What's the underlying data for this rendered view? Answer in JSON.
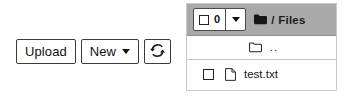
{
  "toolbar": {
    "upload_label": "Upload",
    "new_label": "New",
    "new_caret_icon": "caret-down-icon",
    "refresh_icon": "refresh-icon"
  },
  "file_panel": {
    "header": {
      "select_all_checkbox_icon": "checkbox-unchecked-icon",
      "selected_count": "0",
      "select_menu_caret_icon": "caret-down-icon",
      "breadcrumb": {
        "root_icon": "folder-filled-icon",
        "separator": "/",
        "label": "Files"
      }
    },
    "columns": [
      "select",
      "icon",
      "name"
    ],
    "rows": [
      {
        "type": "parent-directory",
        "checkbox": false,
        "icon": "folder-outline-icon",
        "name": ".."
      },
      {
        "type": "file",
        "checkbox": true,
        "icon": "file-outline-icon",
        "name": "test.txt"
      }
    ]
  },
  "colors": {
    "header_background": "#a9a9a9",
    "panel_border": "#c9c9c9",
    "text": "#1a1a1a",
    "button_border": "#3a3a3a",
    "surface": "#ffffff"
  }
}
